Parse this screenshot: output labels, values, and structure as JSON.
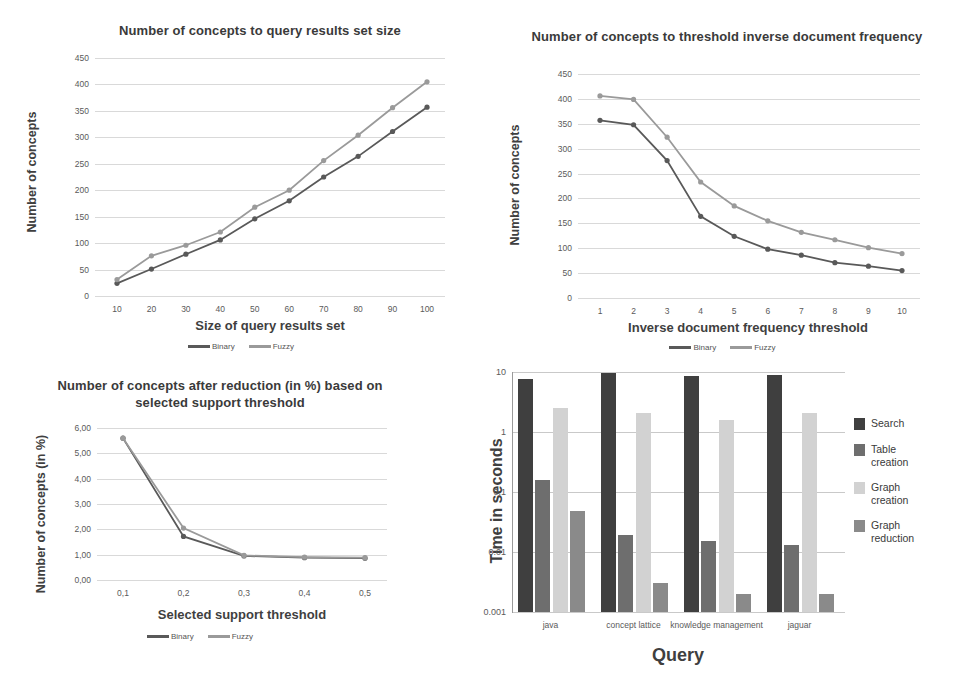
{
  "charts": [
    {
      "id": "concepts-vs-result-set",
      "title": "Number of concepts to query results set size",
      "type": "line",
      "xlabel": "Size of query results set",
      "ylabel": "Number of concepts",
      "categories": [
        "10",
        "20",
        "30",
        "40",
        "50",
        "60",
        "70",
        "80",
        "90",
        "100"
      ],
      "yticks": [
        "0",
        "50",
        "100",
        "150",
        "200",
        "250",
        "300",
        "350",
        "400",
        "450"
      ],
      "ylim": [
        0,
        450
      ],
      "grid": true,
      "legend_position": "bottom",
      "series": [
        {
          "name": "Binary",
          "color": "#595959",
          "values": [
            24,
            51,
            79,
            106,
            146,
            180,
            225,
            264,
            311,
            357
          ]
        },
        {
          "name": "Fuzzy",
          "color": "#9a9a9a",
          "values": [
            31,
            76,
            96,
            121,
            168,
            200,
            256,
            304,
            356,
            405
          ]
        }
      ]
    },
    {
      "id": "concepts-vs-idf-threshold",
      "title": "Number of concepts to threshold inverse document frequency",
      "type": "line",
      "xlabel": "Inverse document frequency threshold",
      "ylabel": "Number of concepts",
      "categories": [
        "1",
        "2",
        "3",
        "4",
        "5",
        "6",
        "7",
        "8",
        "9",
        "10"
      ],
      "yticks": [
        "0",
        "50",
        "100",
        "150",
        "200",
        "250",
        "300",
        "350",
        "400",
        "450"
      ],
      "ylim": [
        0,
        450
      ],
      "grid": true,
      "legend_position": "bottom",
      "series": [
        {
          "name": "Binary",
          "color": "#595959",
          "values": [
            357,
            348,
            276,
            164,
            124,
            98,
            86,
            71,
            64,
            55
          ]
        },
        {
          "name": "Fuzzy",
          "color": "#9a9a9a",
          "values": [
            406,
            399,
            323,
            233,
            185,
            155,
            132,
            117,
            101,
            89
          ]
        }
      ]
    },
    {
      "id": "concepts-after-reduction",
      "title": "Number of concepts after reduction (in %) based on selected support threshold",
      "type": "line",
      "xlabel": "Selected support threshold",
      "ylabel": "Number of concepts (in %)",
      "categories": [
        "0,1",
        "0,2",
        "0,3",
        "0,4",
        "0,5"
      ],
      "yticks": [
        "0,00",
        "1,00",
        "2,00",
        "3,00",
        "4,00",
        "5,00",
        "6,00"
      ],
      "ylim": [
        0,
        6
      ],
      "grid": true,
      "legend_position": "bottom",
      "series": [
        {
          "name": "Binary",
          "color": "#595959",
          "values": [
            5.6,
            1.72,
            0.95,
            0.88,
            0.86
          ]
        },
        {
          "name": "Fuzzy",
          "color": "#9a9a9a",
          "values": [
            5.6,
            2.05,
            0.97,
            0.9,
            0.88
          ]
        }
      ]
    },
    {
      "id": "time-per-query",
      "title": "",
      "type": "bar",
      "xlabel": "Query",
      "ylabel": "Time in seconds",
      "scale": "log",
      "categories": [
        "java",
        "concept lattice",
        "knowledge management",
        "jaguar"
      ],
      "yticks": [
        "0.001",
        "0.01",
        "0.1",
        "1",
        "10"
      ],
      "ylim": [
        0.001,
        10
      ],
      "grid": true,
      "legend_position": "right",
      "series": [
        {
          "name": "Search",
          "color": "#3f3f3f",
          "values": [
            7.5,
            9.6,
            8.6,
            9.0
          ]
        },
        {
          "name": "Table\ncreation",
          "color": "#6e6e6e",
          "values": [
            0.16,
            0.019,
            0.015,
            0.013
          ]
        },
        {
          "name": "Graph\ncreation",
          "color": "#d2d2d2",
          "values": [
            2.5,
            2.1,
            1.6,
            2.1
          ]
        },
        {
          "name": "Graph\nreduction",
          "color": "#8a8a8a",
          "values": [
            0.048,
            0.003,
            0.002,
            0.002
          ]
        }
      ]
    }
  ]
}
